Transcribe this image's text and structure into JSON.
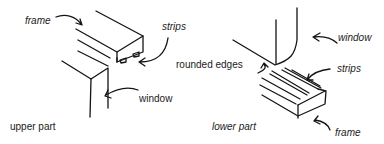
{
  "diagram": {
    "upper": {
      "caption": "upper part",
      "labels": {
        "frame": "frame",
        "strips": "strips",
        "window": "window"
      }
    },
    "lower": {
      "caption": "lower part",
      "labels": {
        "window": "window",
        "rounded_edges": "rounded edges",
        "strips": "strips",
        "frame": "frame"
      }
    }
  }
}
